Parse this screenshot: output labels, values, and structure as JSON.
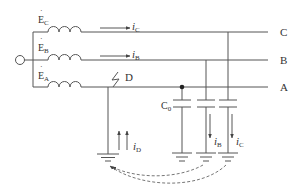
{
  "diagram": {
    "colors": {
      "line": "#555555",
      "text": "#333333",
      "dashed": "#666666"
    },
    "sources": [
      {
        "id": "EC",
        "label": "E",
        "sub": "C"
      },
      {
        "id": "EB",
        "label": "E",
        "sub": "B"
      },
      {
        "id": "EA",
        "label": "E",
        "sub": "A"
      }
    ],
    "phases": [
      {
        "id": "C",
        "label": "C"
      },
      {
        "id": "B",
        "label": "B"
      },
      {
        "id": "A",
        "label": "A"
      }
    ],
    "line_currents": [
      {
        "label": "i",
        "sub": "C"
      },
      {
        "label": "i",
        "sub": "B"
      }
    ],
    "fault": {
      "label": "D"
    },
    "capacitance": {
      "label": "C",
      "sub": "0"
    },
    "branch_currents": [
      {
        "label": "i",
        "sub": "D"
      },
      {
        "label": "i",
        "sub": "B"
      },
      {
        "label": "i",
        "sub": "C"
      }
    ]
  }
}
